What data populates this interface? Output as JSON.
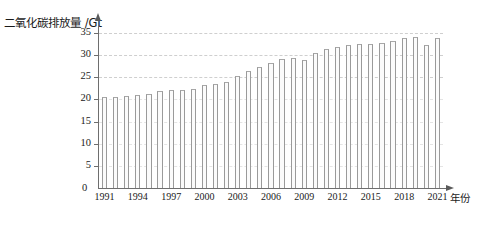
{
  "chart_data": {
    "type": "bar",
    "title": "",
    "ylabel": "二氧化碳排放量 /Gt",
    "xlabel": "年份",
    "ylim": [
      0,
      37.5
    ],
    "yticks": [
      0,
      5,
      10,
      15,
      20,
      25,
      30,
      35
    ],
    "ytick_labels": [
      "0",
      "5",
      "10",
      "15",
      "20",
      "25",
      "30",
      "35"
    ],
    "gridlines": [
      5,
      10,
      15,
      20,
      25,
      30,
      35
    ],
    "grid": true,
    "legend": "none",
    "categories": [
      "1991",
      "1992",
      "1993",
      "1994",
      "1995",
      "1996",
      "1997",
      "1998",
      "1999",
      "2000",
      "2001",
      "2002",
      "2003",
      "2004",
      "2005",
      "2006",
      "2007",
      "2008",
      "2009",
      "2010",
      "2011",
      "2012",
      "2013",
      "2014",
      "2015",
      "2016",
      "2017",
      "2018",
      "2019",
      "2020",
      "2021"
    ],
    "xtick_labels": [
      "1991",
      "1994",
      "1997",
      "2000",
      "2003",
      "2006",
      "2009",
      "2012",
      "2015",
      "2018",
      "2021"
    ],
    "values": [
      20.6,
      20.6,
      20.7,
      21.0,
      21.3,
      21.9,
      22.1,
      22.2,
      22.4,
      23.2,
      23.5,
      24.0,
      25.2,
      26.4,
      27.4,
      28.2,
      29.1,
      29.4,
      29.0,
      30.5,
      31.5,
      31.9,
      32.4,
      32.6,
      32.6,
      32.7,
      33.2,
      34.0,
      34.1,
      32.3,
      34.0
    ],
    "bar_color": "#fbfbfb",
    "bar_edge_color": "#9a9a9a",
    "axis_color": "#6e6e6e",
    "grid_color": "#cfcfcf",
    "text_color": "#1a1a1a"
  }
}
